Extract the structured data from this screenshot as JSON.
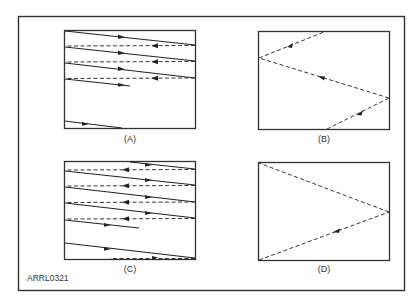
{
  "figure": {
    "id_label": "ARRL0321",
    "colors": {
      "line": "#222222",
      "frame": "#333333",
      "background": "#ffffff"
    }
  },
  "panels": [
    {
      "key": "A",
      "label": "(A)",
      "description": "Interlaced-style raster: solid forward scan lines with dashed retrace lines, partial final line and a line at bottom"
    },
    {
      "key": "B",
      "label": "(B)",
      "description": "Dashed vertical retrace zig-zag: bottom-center to right, right to left, left to top-center"
    },
    {
      "key": "C",
      "label": "(C)",
      "description": "Second field raster offset: solid scan lines and dashed retraces starting mid-line at top"
    },
    {
      "key": "D",
      "label": "(D)",
      "description": "Dashed vertical retrace: bottom-left to right middle, then right middle to top-left"
    }
  ]
}
